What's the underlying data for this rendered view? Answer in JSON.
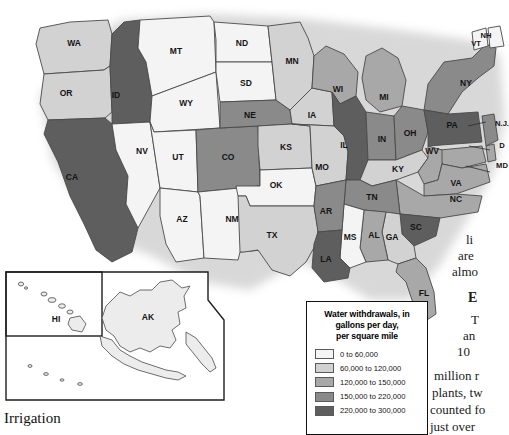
{
  "map": {
    "title": "United States water withdrawals by state",
    "states": [
      {
        "code": "WA",
        "label": "WA",
        "class": 2
      },
      {
        "code": "OR",
        "label": "OR",
        "class": 2
      },
      {
        "code": "ID",
        "label": "ID",
        "class": 5
      },
      {
        "code": "MT",
        "label": "MT",
        "class": 1
      },
      {
        "code": "WY",
        "label": "WY",
        "class": 1
      },
      {
        "code": "ND",
        "label": "ND",
        "class": 1
      },
      {
        "code": "SD",
        "label": "SD",
        "class": 1
      },
      {
        "code": "MN",
        "label": "MN",
        "class": 2
      },
      {
        "code": "WI",
        "label": "WI",
        "class": 3
      },
      {
        "code": "MI",
        "label": "MI",
        "class": 3
      },
      {
        "code": "IA",
        "label": "IA",
        "class": 2
      },
      {
        "code": "NE",
        "label": "NE",
        "class": 4
      },
      {
        "code": "IL",
        "label": "IL",
        "class": 5
      },
      {
        "code": "IN",
        "label": "IN",
        "class": 4
      },
      {
        "code": "OH",
        "label": "OH",
        "class": 4
      },
      {
        "code": "PA",
        "label": "PA",
        "class": 5
      },
      {
        "code": "NY",
        "label": "NY",
        "class": 4
      },
      {
        "code": "NH",
        "label": "NH",
        "class": 1
      },
      {
        "code": "VT",
        "label": "VT",
        "class": 1
      },
      {
        "code": "NJ",
        "label": "N.J.",
        "class": 4
      },
      {
        "code": "DE",
        "label": "D",
        "class": 3
      },
      {
        "code": "MD",
        "label": "MD",
        "class": 3
      },
      {
        "code": "WV",
        "label": "WV",
        "class": 3
      },
      {
        "code": "VA",
        "label": "VA",
        "class": 3
      },
      {
        "code": "KY",
        "label": "KY",
        "class": 2
      },
      {
        "code": "TN",
        "label": "TN",
        "class": 4
      },
      {
        "code": "NC",
        "label": "NC",
        "class": 3
      },
      {
        "code": "SC",
        "label": "SC",
        "class": 5
      },
      {
        "code": "GA",
        "label": "GA",
        "class": 2
      },
      {
        "code": "AL",
        "label": "AL",
        "class": 3
      },
      {
        "code": "MS",
        "label": "MS",
        "class": 1
      },
      {
        "code": "FL",
        "label": "FL",
        "class": 3
      },
      {
        "code": "LA",
        "label": "LA",
        "class": 5
      },
      {
        "code": "AR",
        "label": "AR",
        "class": 4
      },
      {
        "code": "MO",
        "label": "MO",
        "class": 2
      },
      {
        "code": "KS",
        "label": "KS",
        "class": 2
      },
      {
        "code": "OK",
        "label": "OK",
        "class": 1
      },
      {
        "code": "TX",
        "label": "TX",
        "class": 2
      },
      {
        "code": "NM",
        "label": "NM",
        "class": 1
      },
      {
        "code": "AZ",
        "label": "AZ",
        "class": 1
      },
      {
        "code": "UT",
        "label": "UT",
        "class": 1
      },
      {
        "code": "CO",
        "label": "CO",
        "class": 4
      },
      {
        "code": "NV",
        "label": "NV",
        "class": 1
      },
      {
        "code": "CA",
        "label": "CA",
        "class": 5
      },
      {
        "code": "AK",
        "label": "AK",
        "class": 1
      },
      {
        "code": "HI",
        "label": "HI",
        "class": 1
      }
    ]
  },
  "legend": {
    "title_line1": "Water withdrawals, in",
    "title_line2": "gallons per day,",
    "title_line3": "per square mile",
    "entries": [
      {
        "label": "0 to 60,000",
        "color": "#f4f4f4"
      },
      {
        "label": "60,000 to 120,000",
        "color": "#d2d2d2"
      },
      {
        "label": "120,000 to 150,000",
        "color": "#a8a8a8"
      },
      {
        "label": "150,000 to 220,000",
        "color": "#8a8a8a"
      },
      {
        "label": "220,000 to 300,000",
        "color": "#5e5e5e"
      }
    ]
  },
  "article": {
    "section_heading": "Irrigation",
    "fragments": {
      "f1": "li",
      "f2": "are",
      "f3": "almo",
      "head": "E",
      "f4": "T",
      "f5": "an",
      "f6": "10",
      "f7": "million  r",
      "f8": "plants, tw",
      "f9": "counted fo",
      "f10": "just over"
    }
  },
  "colors": {
    "class1": "#f4f4f4",
    "class2": "#d2d2d2",
    "class3": "#a8a8a8",
    "class4": "#8a8a8a",
    "class5": "#5e5e5e",
    "outline": "#4a4a4a",
    "halo": "#d8d8d8"
  }
}
